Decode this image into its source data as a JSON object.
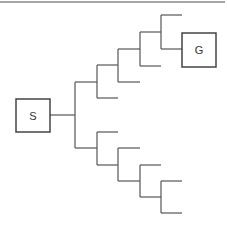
{
  "diagram": {
    "type": "search-tree",
    "start_node": {
      "label": "S"
    },
    "goal_node": {
      "label": "G"
    },
    "colors": {
      "line": "#555555",
      "box_border": "#444444",
      "text": "#333333",
      "top_rule": "#888888"
    }
  }
}
